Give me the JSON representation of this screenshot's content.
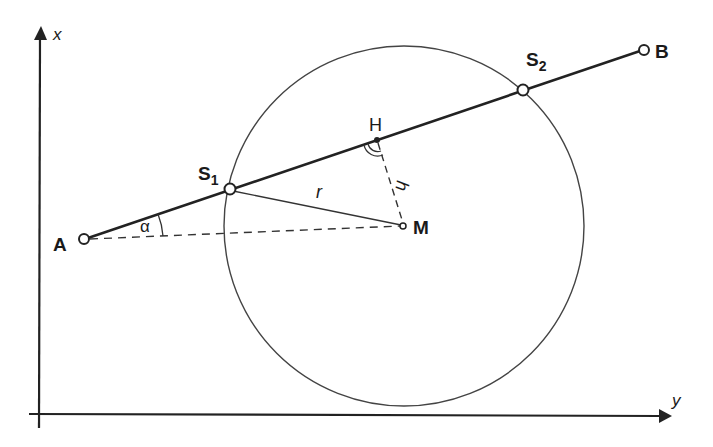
{
  "diagram": {
    "title": "",
    "axes": {
      "vertical_label": "x",
      "horizontal_label": "y",
      "origin": [
        38,
        414
      ],
      "vertical_top": 26,
      "horizontal_right": 672
    },
    "circle": {
      "center_label": "M",
      "cx": 404,
      "cy": 226,
      "r": 180,
      "color": "#444444"
    },
    "points": {
      "A": {
        "label": "A",
        "x": 84,
        "y": 239
      },
      "B": {
        "label": "B",
        "x": 644,
        "y": 50
      },
      "S1": {
        "label": "S",
        "sub": "1",
        "x": 230,
        "y": 189
      },
      "S2": {
        "label": "S",
        "sub": "2",
        "x": 523,
        "y": 90
      },
      "H": {
        "label": "H",
        "x": 377,
        "y": 140
      },
      "M": {
        "label": "M",
        "x": 404,
        "y": 226
      }
    },
    "segments": {
      "AB": {
        "from": "A",
        "to": "B",
        "style": "solid-thick"
      },
      "S1M": {
        "from": "S1",
        "to": "M",
        "label": "r",
        "style": "solid-thin"
      },
      "HM": {
        "from": "H",
        "to": "M",
        "label": "h",
        "style": "dashed"
      },
      "AM": {
        "from": "A",
        "to": "M",
        "style": "dashed"
      }
    },
    "angles": {
      "alpha": {
        "label": "α",
        "vertex": "A"
      },
      "right_angle": {
        "vertex": "H",
        "marker": "double-arc"
      }
    },
    "colors": {
      "ink": "#222222",
      "thin": "#444444",
      "background": "#ffffff"
    }
  }
}
